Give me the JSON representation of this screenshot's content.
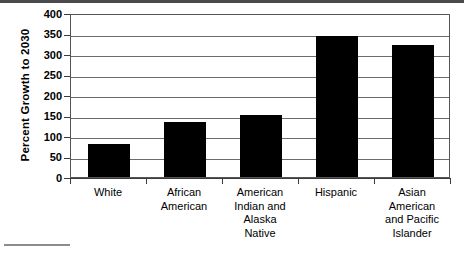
{
  "chart_data": {
    "type": "bar",
    "title": "",
    "subtitle": "",
    "xlabel": "",
    "ylabel": "Percent Growth to 2030",
    "ylim": [
      0,
      400
    ],
    "yticks": [
      0,
      50,
      100,
      150,
      200,
      250,
      300,
      350,
      400
    ],
    "grid": true,
    "legend": "none",
    "orientation": "vertical",
    "bar_color": "#000000",
    "background_color": "#ffffff",
    "categories": [
      "White",
      "African American",
      "American Indian and Alaska Native",
      "Hispanic",
      "Asian American and Pacific Islander"
    ],
    "category_lines": [
      [
        "White"
      ],
      [
        "African",
        "American"
      ],
      [
        "American",
        "Indian and",
        "Alaska",
        "Native"
      ],
      [
        "Hispanic"
      ],
      [
        "Asian",
        "American",
        "and Pacific",
        "Islander"
      ]
    ],
    "values": [
      80,
      133,
      152,
      343,
      323
    ]
  },
  "axes": {
    "y_title": "Percent Growth to 2030",
    "y_tick_labels": [
      "400",
      "350",
      "300",
      "250",
      "200",
      "150",
      "100",
      "50",
      "0"
    ]
  },
  "decorations": {
    "top_rule_color": "#4a4a4a",
    "bottom_rule_color": "#8c8c8c"
  }
}
